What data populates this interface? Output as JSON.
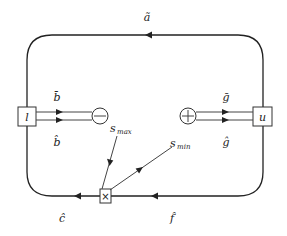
{
  "diagram": {
    "type": "signal-flow loop diagram",
    "nodes": {
      "l_box": {
        "label": "l"
      },
      "u_box": {
        "label": "u"
      },
      "minus_node": {
        "symbol": "−"
      },
      "plus_node": {
        "symbol": "+"
      },
      "multiply_node": {
        "symbol": "×"
      }
    },
    "edge_labels": {
      "top": "ã",
      "b_bar": "b̄",
      "b_hat": "b̂",
      "g_bar": "ḡ",
      "g_hat": "ĝ",
      "c_hat": "ĉ",
      "f_hat": "f̂"
    },
    "inputs": {
      "s_max": {
        "base": "s",
        "sub": "max"
      },
      "s_min": {
        "base": "s",
        "sub": "min"
      }
    },
    "colors": {
      "stroke": "#222222",
      "background": "#ffffff"
    }
  }
}
